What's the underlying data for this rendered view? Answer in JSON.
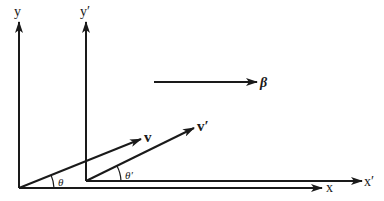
{
  "diagram": {
    "colors": {
      "ink": "#1a1a1a",
      "background": "#ffffff"
    },
    "frame_unprimed": {
      "x_label": "x",
      "y_label": "y",
      "origin": [
        19,
        188
      ]
    },
    "frame_primed": {
      "x_label": "x′",
      "y_label": "y′",
      "origin": [
        86,
        181
      ]
    },
    "vectors": {
      "v": {
        "label": "v",
        "angle_label": "θ"
      },
      "v_prime": {
        "label": "v′",
        "angle_label": "θ′"
      },
      "beta": {
        "label": "β"
      }
    }
  }
}
